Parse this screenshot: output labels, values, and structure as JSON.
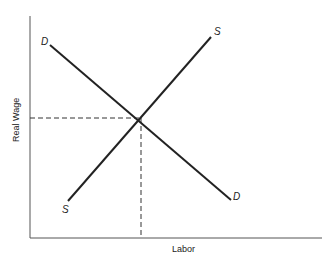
{
  "diagram": {
    "type": "supply-demand",
    "axes": {
      "x_label": "Labor",
      "y_label": "Real Wage"
    },
    "curves": [
      {
        "name": "demand",
        "label_start": "D",
        "label_end": "D",
        "slope": "downward"
      },
      {
        "name": "supply",
        "label_start": "S",
        "label_end": "S",
        "slope": "upward"
      }
    ],
    "equilibrium": {
      "guides": "dashed lines to both axes"
    },
    "colors": {
      "line": "#222222",
      "axis": "#555555",
      "background": "#ffffff"
    }
  }
}
